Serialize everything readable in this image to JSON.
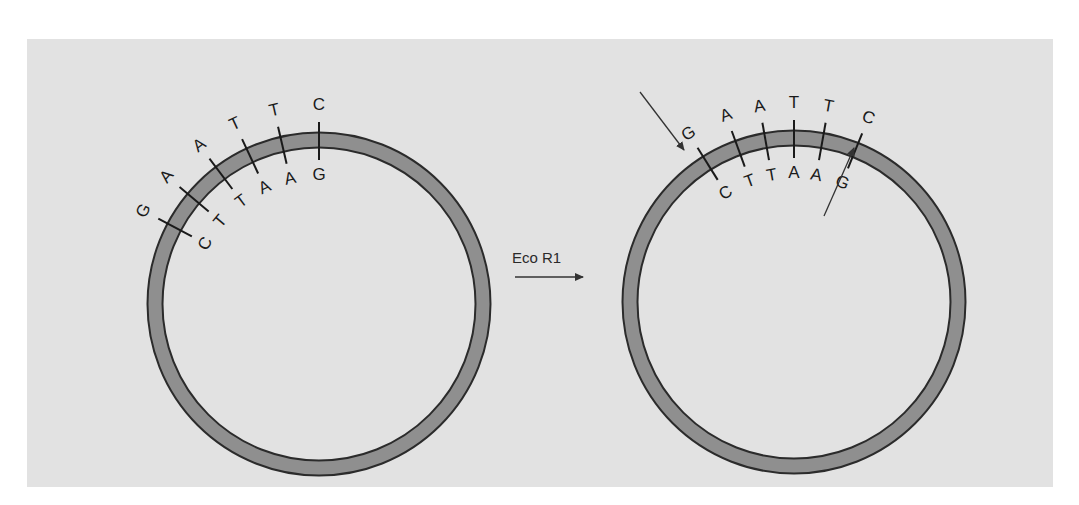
{
  "diagram": {
    "type": "restriction-enzyme-cut-plasmid",
    "enzyme_label": "Eco R1",
    "colors": {
      "panel_bg": "#e2e2e2",
      "ring_fill": "#8f8f8f",
      "ring_stroke": "#2b2b2b",
      "text": "#1a1a1a"
    },
    "left_plasmid": {
      "top_strand": [
        "G",
        "A",
        "A",
        "T",
        "T",
        "C"
      ],
      "bottom_strand": [
        "C",
        "T",
        "T",
        "A",
        "A",
        "G"
      ]
    },
    "right_plasmid": {
      "top_strand": [
        "G",
        "A",
        "A",
        "T",
        "T",
        "C"
      ],
      "bottom_strand": [
        "C",
        "T",
        "T",
        "A",
        "A",
        "G"
      ],
      "cut_arrows": [
        "top-strand-cut-between-G-and-A",
        "bottom-strand-cut-between-A-and-G"
      ]
    }
  }
}
